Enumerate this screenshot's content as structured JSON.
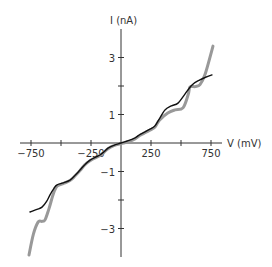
{
  "chart_data": {
    "type": "line",
    "title": "",
    "xlabel": "V (mV)",
    "ylabel": "I (nA)",
    "xlim": [
      -800,
      800
    ],
    "ylim": [
      -4,
      4
    ],
    "grid": false,
    "legend": null,
    "x_ticks": [
      -750,
      -500,
      -250,
      250,
      500,
      750
    ],
    "x_tick_labels": [
      "−750",
      "",
      "−250",
      "250",
      "",
      "750"
    ],
    "y_ticks": [
      3,
      2,
      1,
      -1,
      -2,
      -3
    ],
    "y_tick_labels": [
      "3",
      "",
      "1",
      "−1",
      "",
      "−3"
    ],
    "series": [
      {
        "name": "black-thin",
        "color": "#111111",
        "width": 1.4,
        "points": [
          [
            -758,
            -2.42
          ],
          [
            -700,
            -2.33
          ],
          [
            -658,
            -2.25
          ],
          [
            -620,
            -2.05
          ],
          [
            -592,
            -1.82
          ],
          [
            -560,
            -1.6
          ],
          [
            -533,
            -1.47
          ],
          [
            -480,
            -1.4
          ],
          [
            -425,
            -1.3
          ],
          [
            -380,
            -1.12
          ],
          [
            -342,
            -0.95
          ],
          [
            -300,
            -0.75
          ],
          [
            -258,
            -0.6
          ],
          [
            -215,
            -0.5
          ],
          [
            -175,
            -0.42
          ],
          [
            -140,
            -0.3
          ],
          [
            -108,
            -0.18
          ],
          [
            -60,
            -0.08
          ],
          [
            0,
            0.0
          ],
          [
            60,
            0.08
          ],
          [
            117,
            0.18
          ],
          [
            160,
            0.3
          ],
          [
            200,
            0.39
          ],
          [
            245,
            0.5
          ],
          [
            283,
            0.6
          ],
          [
            320,
            0.85
          ],
          [
            367,
            1.16
          ],
          [
            420,
            1.3
          ],
          [
            475,
            1.4
          ],
          [
            530,
            1.7
          ],
          [
            592,
            2.04
          ],
          [
            650,
            2.2
          ],
          [
            700,
            2.3
          ],
          [
            758,
            2.39
          ]
        ]
      },
      {
        "name": "gray-thick",
        "color": "#999999",
        "width": 3,
        "points": [
          [
            -767,
            -3.93
          ],
          [
            -730,
            -3.2
          ],
          [
            -690,
            -2.77
          ],
          [
            -660,
            -2.75
          ],
          [
            -633,
            -2.7
          ],
          [
            -600,
            -2.3
          ],
          [
            -565,
            -1.8
          ],
          [
            -533,
            -1.52
          ],
          [
            -480,
            -1.42
          ],
          [
            -425,
            -1.32
          ],
          [
            -380,
            -1.14
          ],
          [
            -342,
            -0.97
          ],
          [
            -300,
            -0.76
          ],
          [
            -258,
            -0.62
          ],
          [
            -215,
            -0.52
          ],
          [
            -175,
            -0.44
          ],
          [
            -140,
            -0.32
          ],
          [
            -108,
            -0.2
          ],
          [
            -60,
            -0.09
          ],
          [
            0,
            -0.02
          ],
          [
            60,
            0.04
          ],
          [
            117,
            0.14
          ],
          [
            160,
            0.27
          ],
          [
            200,
            0.36
          ],
          [
            245,
            0.46
          ],
          [
            283,
            0.56
          ],
          [
            320,
            0.8
          ],
          [
            390,
            1.05
          ],
          [
            450,
            1.16
          ],
          [
            517,
            1.23
          ],
          [
            560,
            1.7
          ],
          [
            575,
            1.96
          ],
          [
            620,
            1.98
          ],
          [
            658,
            2.05
          ],
          [
            700,
            2.4
          ],
          [
            767,
            3.4
          ]
        ]
      }
    ]
  }
}
